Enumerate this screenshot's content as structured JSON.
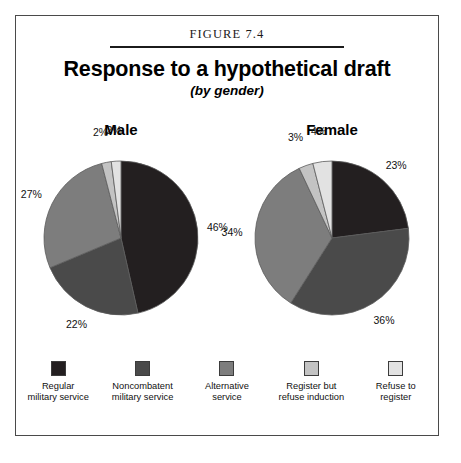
{
  "figure": {
    "number_label": "FIGURE 7.4",
    "title": "Response to a hypothetical draft",
    "subtitle": "(by gender)"
  },
  "legend": {
    "items": [
      {
        "label_line1": "Regular",
        "label_line2": "military service",
        "color": "#231f20"
      },
      {
        "label_line1": "Noncombatent",
        "label_line2": "military service",
        "color": "#4a4a4a"
      },
      {
        "label_line1": "Alternative",
        "label_line2": "service",
        "color": "#7d7d7d"
      },
      {
        "label_line1": "Register but",
        "label_line2": "refuse induction",
        "color": "#c3c3c3"
      },
      {
        "label_line1": "Refuse to",
        "label_line2": "register",
        "color": "#e2e2e2"
      }
    ]
  },
  "chart_data": {
    "type": "pie",
    "title": "Response to a hypothetical draft",
    "subtitle": "(by gender)",
    "categories": [
      "Regular military service",
      "Noncombatent military service",
      "Alternative service",
      "Register but refuse induction",
      "Refuse to register"
    ],
    "colors": [
      "#231f20",
      "#4a4a4a",
      "#7d7d7d",
      "#c3c3c3",
      "#e2e2e2"
    ],
    "legend_position": "bottom",
    "units": "percent",
    "charts": [
      {
        "name": "Male",
        "values": [
          46,
          22,
          27,
          2,
          2
        ],
        "labels": [
          "46%",
          "22%",
          "27%",
          "2%",
          "2%"
        ]
      },
      {
        "name": "Female",
        "values": [
          23,
          36,
          34,
          3,
          4
        ],
        "labels": [
          "23%",
          "36%",
          "34%",
          "3%",
          "4%"
        ]
      }
    ]
  }
}
